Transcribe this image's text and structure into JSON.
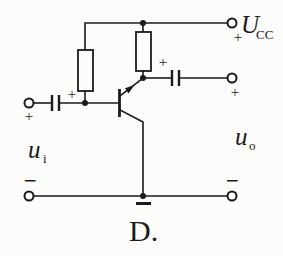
{
  "colors": {
    "ink": "#1b1b1b",
    "paper": "#fcfcfa"
  },
  "caption": "D.",
  "supply": {
    "symbol": "U",
    "subscript": "CC",
    "plus": "+"
  },
  "input": {
    "symbol": "u",
    "subscript": "i",
    "terminal_plus": "+",
    "terminal_minus": "−",
    "cap_plus": "+"
  },
  "output": {
    "symbol": "u",
    "subscript": "o",
    "terminal_plus": "+",
    "terminal_minus": "−",
    "cap_plus": "+"
  },
  "symbols": {
    "transistor": "npn-bjt-transistor",
    "resistor_left": "left-bias-resistor",
    "resistor_right": "right-load-resistor",
    "capacitor_left": "input-coupling-capacitor",
    "capacitor_right": "output-coupling-capacitor",
    "ground": "earth-ground"
  }
}
